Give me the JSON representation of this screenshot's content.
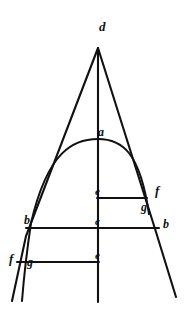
{
  "figure": {
    "background_color": "#ffffff",
    "ink_color": "#111111",
    "width": 190,
    "height": 314
  },
  "labels": [
    {
      "id": "d-apex",
      "text": "d",
      "x": 99,
      "y": 20,
      "size": 13
    },
    {
      "id": "a-vertex",
      "text": "a",
      "x": 98,
      "y": 126,
      "size": 12
    },
    {
      "id": "e-upper-axis",
      "text": "e",
      "x": 95,
      "y": 186,
      "size": 11
    },
    {
      "id": "f-right-upper",
      "text": "f",
      "x": 155,
      "y": 184,
      "size": 13
    },
    {
      "id": "g-right-lower",
      "text": "g",
      "x": 141,
      "y": 201,
      "size": 12
    },
    {
      "id": "b-left",
      "text": "b",
      "x": 24,
      "y": 214,
      "size": 12
    },
    {
      "id": "c-center",
      "text": "c",
      "x": 95,
      "y": 216,
      "size": 11
    },
    {
      "id": "b-right",
      "text": "b",
      "x": 163,
      "y": 218,
      "size": 12
    },
    {
      "id": "f-left-lower",
      "text": "f",
      "x": 9,
      "y": 252,
      "size": 13
    },
    {
      "id": "g-left-lower",
      "text": "g",
      "x": 27,
      "y": 256,
      "size": 12
    },
    {
      "id": "e-lower-axis",
      "text": "e",
      "x": 95,
      "y": 250,
      "size": 11
    }
  ],
  "geometry": {
    "apex": {
      "x": 98,
      "y": 48
    },
    "axis": {
      "x": 98,
      "y_top": 48,
      "y_bottom": 302
    },
    "left_side": {
      "x1": 98,
      "y1": 48,
      "x2": 26,
      "y2": 236
    },
    "left_side_ext": {
      "x1": 26,
      "y1": 236,
      "x2": 12,
      "y2": 300
    },
    "right_side": {
      "x1": 98,
      "y1": 48,
      "x2": 156,
      "y2": 232
    },
    "right_side_ext": {
      "x1": 156,
      "y1": 232,
      "x2": 176,
      "y2": 297
    },
    "parabola": {
      "vertex": {
        "x": 98,
        "y": 139
      },
      "left_end": {
        "x": 32,
        "y": 222
      },
      "right_end": {
        "x": 148,
        "y": 212
      },
      "left_ctrl": {
        "x": 56,
        "y": 142
      },
      "right_ctrl": {
        "x": 134,
        "y": 138
      }
    },
    "chord_eg": {
      "x1": 98,
      "y1": 198,
      "x2": 146,
      "y2": 198
    },
    "chord_bcb": {
      "x1": 27,
      "y1": 228,
      "x2": 158,
      "y2": 228
    },
    "chord_fge": {
      "x1": 17,
      "y1": 262,
      "x2": 98,
      "y2": 262
    },
    "parabola_tail": {
      "from": {
        "x": 32,
        "y": 222
      },
      "to": {
        "x": 20,
        "y": 300
      },
      "ctrl": {
        "x": 24,
        "y": 258
      }
    }
  }
}
